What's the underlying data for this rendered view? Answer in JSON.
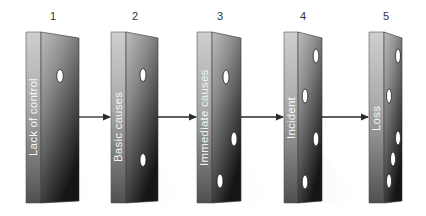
{
  "diagram": {
    "colors": {
      "background": "#ffffff",
      "side_face_light": "#c9c9c9",
      "side_face_dark": "#4a4a4a",
      "front_face_light": "#b5b5b5",
      "front_face_dark": "#1c1c1c",
      "arrow": "#2a2a2a",
      "hole": "#ffffff",
      "label_text": "#f4f4f4",
      "number_text": "#333333"
    },
    "blocks": [
      {
        "number": "1",
        "label": "Lack of control",
        "holes": 1
      },
      {
        "number": "2",
        "label": "Basic causes",
        "holes": 2
      },
      {
        "number": "3",
        "label": "Immediate causes",
        "holes": 3
      },
      {
        "number": "4",
        "label": "Incident",
        "holes": 4
      },
      {
        "number": "5",
        "label": "Loss",
        "holes": 5
      }
    ],
    "arrows": [
      {
        "from": "1",
        "to": "2"
      },
      {
        "from": "2",
        "to": "3"
      },
      {
        "from": "3",
        "to": "4"
      },
      {
        "from": "4",
        "to": "5"
      }
    ]
  }
}
